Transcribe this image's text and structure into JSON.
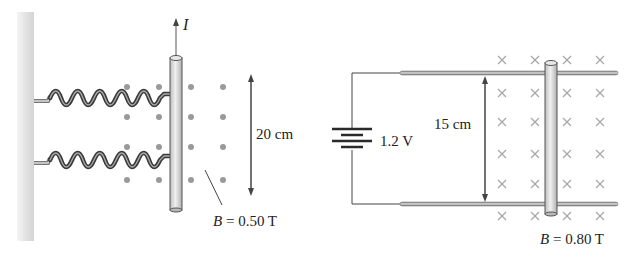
{
  "figure": {
    "left_panel": {
      "current_label": "I",
      "dimension_label": "20 cm",
      "field_label_symbol": "B",
      "field_label_value": "= 0.50 T",
      "field_direction": "out-of-page (dots)",
      "spring_count": 2
    },
    "right_panel": {
      "battery_label": "1.2 V",
      "dimension_label": "15 cm",
      "field_label_symbol": "B",
      "field_label_value": "= 0.80 T",
      "field_direction": "into-page (crosses)"
    },
    "colors": {
      "wall": "#e4e4e4",
      "rod_fill": "#d6d6d6",
      "rod_edge": "#555555",
      "field_dot": "#9a9a9a",
      "field_cross": "#a8a8a8",
      "wire": "#444444",
      "text": "#222222"
    }
  }
}
